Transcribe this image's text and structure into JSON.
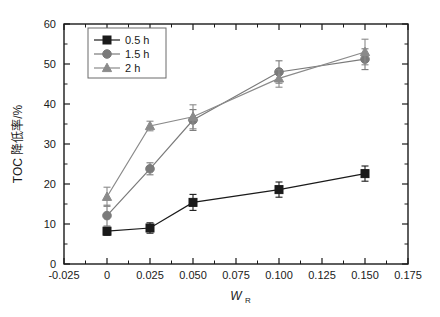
{
  "chart_data": {
    "type": "line",
    "title": "",
    "xlabel": "W_R",
    "xlabel_base": "W",
    "xlabel_sub": "R",
    "ylabel": "TOC 降低率/%",
    "x": [
      0,
      0.025,
      0.05,
      0.1,
      0.15
    ],
    "xlim": [
      -0.025,
      0.175
    ],
    "ylim": [
      0,
      60
    ],
    "xticks": [
      -0.025,
      0,
      0.025,
      0.05,
      0.075,
      0.1,
      0.125,
      0.15,
      0.175
    ],
    "xticklabels": [
      "-0.025",
      "0",
      "0.025",
      "0.050",
      "0.075",
      "0.100",
      "0.125",
      "0.150",
      "0.175"
    ],
    "yticks": [
      0,
      10,
      20,
      30,
      40,
      50,
      60
    ],
    "yticklabels": [
      "0",
      "10",
      "20",
      "30",
      "40",
      "50",
      "60"
    ],
    "x_minor_step": 0.0125,
    "y_minor_step": 5,
    "grid": false,
    "legend_position": "upper-left",
    "series": [
      {
        "name": "0.5 h",
        "marker": "square",
        "color": "#1a1a1a",
        "values": [
          8.2,
          9.0,
          15.4,
          18.6,
          22.6
        ],
        "errors": [
          1.0,
          1.3,
          2.0,
          1.9,
          1.9
        ]
      },
      {
        "name": "1.5 h",
        "marker": "circle",
        "color": "#7a7a7a",
        "values": [
          12.1,
          23.8,
          36.0,
          48.0,
          51.2
        ],
        "errors": [
          2.6,
          1.5,
          2.6,
          2.8,
          2.6
        ]
      },
      {
        "name": "2 h",
        "marker": "triangle",
        "color": "#8a8a8a",
        "values": [
          16.8,
          34.5,
          36.8,
          46.4,
          53.0
        ],
        "errors": [
          2.4,
          1.2,
          3.0,
          2.2,
          3.2
        ]
      }
    ]
  },
  "legend": {
    "entries": [
      "0.5 h",
      "1.5 h",
      "2 h"
    ]
  }
}
